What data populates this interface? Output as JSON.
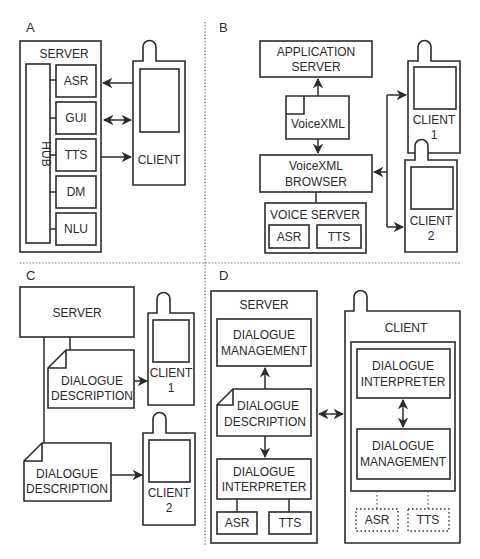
{
  "panels": {
    "a": {
      "label": "A",
      "server": "SERVER",
      "hub": "HUB",
      "modules": [
        "ASR",
        "GUI",
        "TTS",
        "DM",
        "NLU"
      ],
      "client": "CLIENT"
    },
    "b": {
      "label": "B",
      "app_server_line1": "APPLICATION",
      "app_server_line2": "SERVER",
      "document": "VoiceXML",
      "browser_line1": "VoiceXML",
      "browser_line2": "BROWSER",
      "voice_server": "VOICE SERVER",
      "asr": "ASR",
      "tts": "TTS",
      "client1_line1": "CLIENT",
      "client1_line2": "1",
      "client2_line1": "CLIENT",
      "client2_line2": "2"
    },
    "c": {
      "label": "C",
      "server": "SERVER",
      "doc1_line1": "DIALOGUE",
      "doc1_line2": "DESCRIPTION",
      "doc2_line1": "DIALOGUE",
      "doc2_line2": "DESCRIPTION",
      "client1_line1": "CLIENT",
      "client1_line2": "1",
      "client2_line1": "CLIENT",
      "client2_line2": "2"
    },
    "d": {
      "label": "D",
      "server": "SERVER",
      "server_dm_line1": "DIALOGUE",
      "server_dm_line2": "MANAGEMENT",
      "server_doc_line1": "DIALOGUE",
      "server_doc_line2": "DESCRIPTION",
      "server_di_line1": "DIALOGUE",
      "server_di_line2": "INTERPRETER",
      "server_asr": "ASR",
      "server_tts": "TTS",
      "client": "CLIENT",
      "client_di_line1": "DIALOGUE",
      "client_di_line2": "INTERPRETER",
      "client_dm_line1": "DIALOGUE",
      "client_dm_line2": "MANAGEMENT",
      "client_asr": "ASR",
      "client_tts": "TTS"
    }
  },
  "colors": {
    "stroke": "#2b2b2b",
    "background": "#ffffff"
  }
}
